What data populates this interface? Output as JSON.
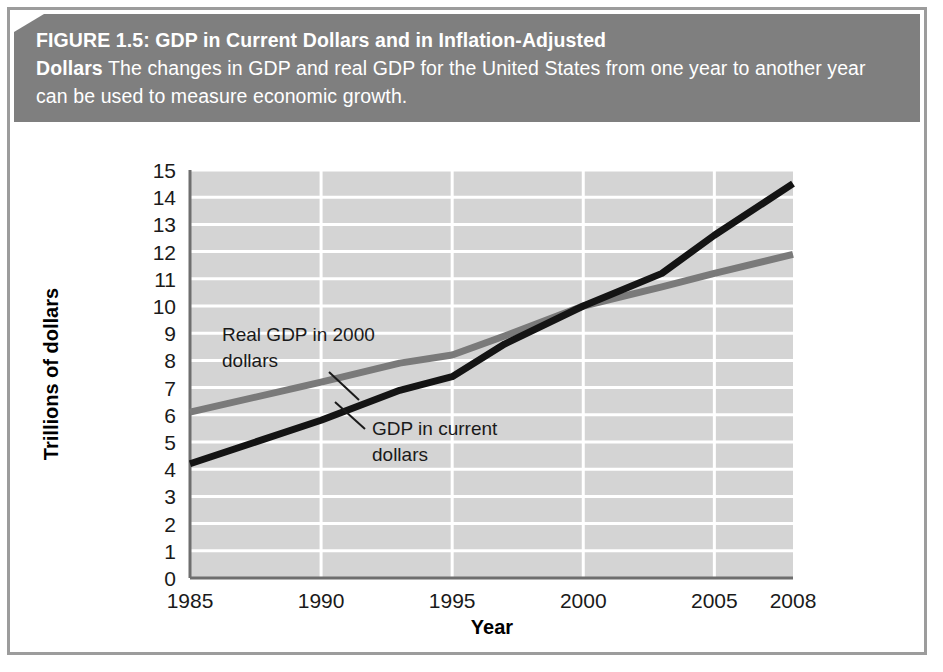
{
  "figure": {
    "label": "FIGURE 1.5:",
    "title": "GDP in Current Dollars and in Inflation-Adjusted Dollars",
    "title_line1": "FIGURE 1.5: GDP in Current Dollars and in Inflation-Adjusted",
    "title_line2_bold": "Dollars",
    "caption_rest": " The changes in GDP and real GDP for the United States from one year to another year can be used to measure economic growth.",
    "banner_color": "#7f7f7f",
    "banner_text_color": "#ffffff",
    "frame_color": "#9c9c9c"
  },
  "chart_data": {
    "type": "line",
    "title": "GDP in Current Dollars and in Inflation-Adjusted Dollars",
    "xlabel": "Year",
    "ylabel": "Trillions of dollars",
    "xlim": [
      1985,
      2008
    ],
    "ylim": [
      0,
      15
    ],
    "grid": true,
    "legend_position": "inline-annotation",
    "plot_background": "#d4d4d4",
    "gridline_color": "#ffffff",
    "xticks": [
      1985,
      1990,
      1995,
      2000,
      2005,
      2008
    ],
    "xtick_labels": [
      "1985",
      "1990",
      "1995",
      "2000",
      "2005",
      "2008"
    ],
    "yticks": [
      0,
      1,
      2,
      3,
      4,
      5,
      6,
      7,
      8,
      9,
      10,
      11,
      12,
      13,
      14,
      15
    ],
    "ytick_labels": [
      "0",
      "1",
      "2",
      "3",
      "4",
      "5",
      "6",
      "7",
      "8",
      "9",
      "10",
      "11",
      "12",
      "13",
      "14",
      "15"
    ],
    "series": [
      {
        "name": "Real GDP in 2000 dollars",
        "color": "#7a7a7a",
        "width": 7,
        "annotation": "Real GDP in 2000 dollars",
        "annotation_line1": "Real GDP in 2000",
        "annotation_line2": "dollars",
        "x": [
          1985,
          1990,
          1993,
          1995,
          1997,
          2000,
          2003,
          2005,
          2008
        ],
        "values": [
          6.1,
          7.2,
          7.9,
          8.2,
          8.9,
          10.0,
          10.7,
          11.2,
          11.9
        ]
      },
      {
        "name": "GDP in current dollars",
        "color": "#141414",
        "width": 7,
        "annotation": "GDP in current dollars",
        "annotation_line1": "GDP in current",
        "annotation_line2": "dollars",
        "x": [
          1985,
          1990,
          1993,
          1995,
          1997,
          2000,
          2003,
          2005,
          2008
        ],
        "values": [
          4.2,
          5.8,
          6.9,
          7.4,
          8.6,
          10.0,
          11.2,
          12.6,
          14.5
        ]
      }
    ]
  }
}
